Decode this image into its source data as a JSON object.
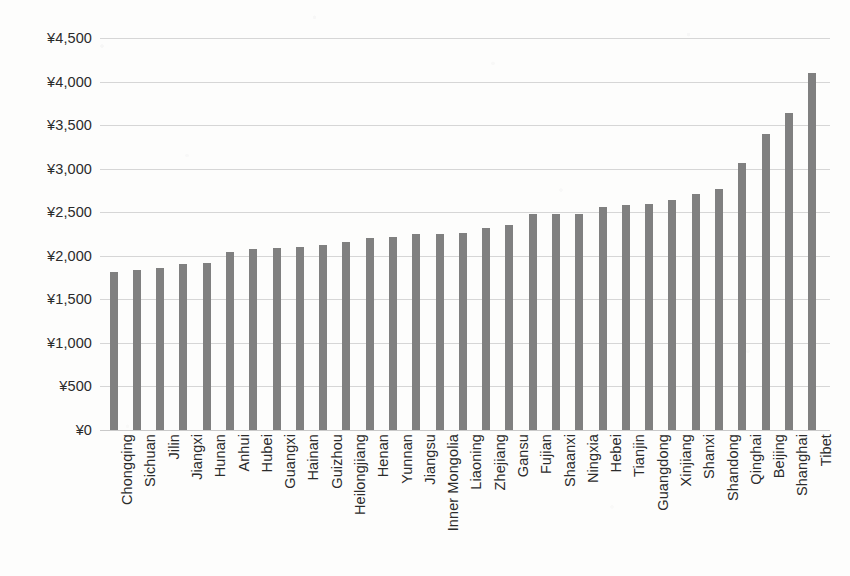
{
  "chart_data": {
    "type": "bar",
    "title": "",
    "subtitle": "",
    "xlabel": "",
    "ylabel": "",
    "ylim": [
      0,
      4500
    ],
    "y_tick_labels": [
      "¥4,500",
      "¥4,000",
      "¥3,500",
      "¥3,000",
      "¥2,500",
      "¥2,000",
      "¥1,500",
      "¥1,000",
      "¥500",
      "¥0"
    ],
    "y_tick_values": [
      4500,
      4000,
      3500,
      3000,
      2500,
      2000,
      1500,
      1000,
      500,
      0
    ],
    "grid": true,
    "grid_axis": "y",
    "legend": false,
    "legend_position": "none",
    "currency_symbol": "¥",
    "bar_color": "#808080",
    "gridline_color": "#d6d6d6",
    "background_color": "#fdfdfc",
    "categories": [
      "Chongqing",
      "Sichuan",
      "Jilin",
      "Jiangxi",
      "Hunan",
      "Anhui",
      "Hubei",
      "Guangxi",
      "Hainan",
      "Guizhou",
      "Heilongjiang",
      "Henan",
      "Yunnan",
      "Jiangsu",
      "Inner Mongolia",
      "Liaoning",
      "Zhejiang",
      "Gansu",
      "Fujian",
      "Shaanxi",
      "Ningxia",
      "Hebei",
      "Tianjin",
      "Guangdong",
      "Xinjiang",
      "Shanxi",
      "Shandong",
      "Qinghai",
      "Beijing",
      "Shanghai",
      "Tibet"
    ],
    "values": [
      1810,
      1840,
      1855,
      1905,
      1915,
      2040,
      2075,
      2090,
      2100,
      2125,
      2160,
      2200,
      2215,
      2245,
      2255,
      2265,
      2320,
      2355,
      2475,
      2480,
      2485,
      2565,
      2585,
      2600,
      2645,
      2715,
      2765,
      3060,
      3400,
      3640,
      4100
    ]
  }
}
